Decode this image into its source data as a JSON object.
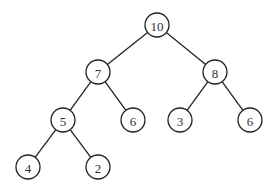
{
  "diagram": {
    "type": "binary-tree",
    "node_radius": 12,
    "colors": {
      "stroke": "#222222",
      "text": "#333333",
      "fill": "#ffffff",
      "background": "#ffffff"
    },
    "nodes": [
      {
        "id": "n0",
        "label": "10",
        "x": 157,
        "y": 25
      },
      {
        "id": "n1",
        "label": "7",
        "x": 98,
        "y": 72
      },
      {
        "id": "n2",
        "label": "8",
        "x": 215,
        "y": 72
      },
      {
        "id": "n3",
        "label": "5",
        "x": 63,
        "y": 120
      },
      {
        "id": "n4",
        "label": "6",
        "x": 133,
        "y": 120
      },
      {
        "id": "n5",
        "label": "3",
        "x": 180,
        "y": 120
      },
      {
        "id": "n6",
        "label": "6",
        "x": 250,
        "y": 120
      },
      {
        "id": "n7",
        "label": "4",
        "x": 28,
        "y": 167
      },
      {
        "id": "n8",
        "label": "2",
        "x": 98,
        "y": 167
      }
    ],
    "edges": [
      {
        "from": "n0",
        "to": "n1"
      },
      {
        "from": "n0",
        "to": "n2"
      },
      {
        "from": "n1",
        "to": "n3"
      },
      {
        "from": "n1",
        "to": "n4"
      },
      {
        "from": "n2",
        "to": "n5"
      },
      {
        "from": "n2",
        "to": "n6"
      },
      {
        "from": "n3",
        "to": "n7"
      },
      {
        "from": "n3",
        "to": "n8"
      }
    ]
  }
}
